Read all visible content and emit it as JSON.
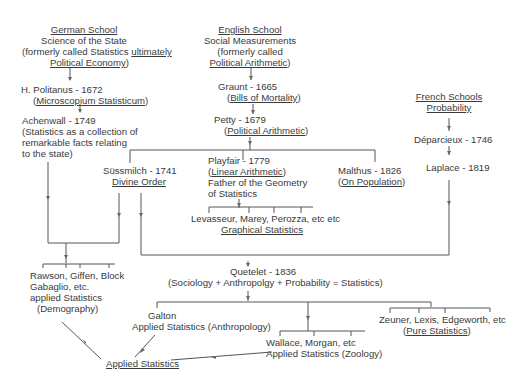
{
  "diagram": {
    "german_school": {
      "title": "German School",
      "line1": "Science of the State",
      "line2a": "(formerly called Statistics ",
      "line2b": "ultimately",
      "line3a": "Political Economy",
      "line3b": ")"
    },
    "politanus": {
      "name": "H. Politanus - 1672",
      "work_open": "(",
      "work": "Microscopium Statisticum",
      "work_close": ")"
    },
    "achenwall": {
      "name": "Achenwall - 1749",
      "l1": "(Statistics as a collection of",
      "l2": "remarkable facts relating",
      "l3": "to the state)"
    },
    "english_school": {
      "title": "English School",
      "line1": "Social Measurements",
      "line2": "(formerly called",
      "line3a": "Political Arithmetic",
      "line3b": ")"
    },
    "graunt": {
      "name": "Graunt - 1665",
      "work_open": "(",
      "work": "Bills of Mortality",
      "work_close": ")"
    },
    "petty": {
      "name": "Petty - 1679",
      "work_open": "(",
      "work": "Political Arithmetic",
      "work_close": ")"
    },
    "french_school": {
      "title": "French Schools",
      "line1": "Probability"
    },
    "deparcieux": {
      "name": "Déparcieux - 1746"
    },
    "laplace": {
      "name": "Laplace - 1819"
    },
    "sussmilch": {
      "name": "Süssmilch - 1741",
      "work": "Divine Order"
    },
    "playfair": {
      "name": "Playfair - 1779",
      "work_open": "(",
      "work": "Linear Arithmetic",
      "work_close": ")",
      "l3": "Father of the Geometry",
      "l4": "of Statistics"
    },
    "malthus": {
      "name": "Malthus - 1826",
      "work_open": "(",
      "work": "On Population",
      "work_close": ")"
    },
    "levasseur": {
      "names": "Levasseur, Marey, Perozza, etc etc",
      "field": "Graphical Statistics"
    },
    "rawson": {
      "l1": "Rawson, Giffen, Block",
      "l2": "Gabaglio, etc.",
      "l3": "applied Statistics",
      "l4": "(Demography)"
    },
    "quetelet": {
      "name": "Quetelet - 1836",
      "formula": "(Sociology + Anthropolgy + Probability = Statistics)"
    },
    "galton": {
      "name": "Galton",
      "field": "Applied Statistics (Anthropology)"
    },
    "wallace": {
      "names": "Wallace, Morgan, etc",
      "field": "Applied Statistics (Zoology)"
    },
    "zeuner": {
      "names": "Zeuner, Lexis, Edgeworth, etc",
      "field_open": "(",
      "field": "Pure Statistics",
      "field_close": ")"
    },
    "applied": {
      "label": "Applied Statistics"
    },
    "colors": {
      "text": "#3a3a3a",
      "lines": "#555555",
      "background": "#ffffff"
    }
  }
}
